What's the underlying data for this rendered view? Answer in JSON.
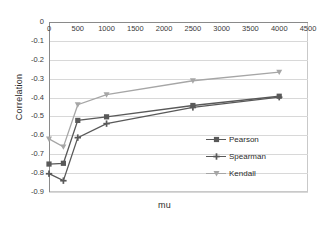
{
  "chart_data": {
    "type": "line",
    "title": "",
    "xlabel": "mu",
    "ylabel": "Correlation",
    "xlim": [
      0,
      4500
    ],
    "ylim": [
      -0.9,
      0
    ],
    "grid": true,
    "legend_position": "inside-right",
    "xticks": [
      "0",
      "500",
      "1000",
      "1500",
      "2000",
      "2500",
      "3000",
      "3500",
      "4000",
      "4500"
    ],
    "yticks": [
      "0",
      "-0.1",
      "-0.2",
      "-0.3",
      "-0.4",
      "-0.5",
      "-0.6",
      "-0.7",
      "-0.8",
      "-0.9"
    ],
    "x": [
      0,
      250,
      500,
      1000,
      2500,
      4000
    ],
    "series": [
      {
        "name": "Pearson",
        "marker": "square",
        "color": "#595959",
        "values": [
          -0.752,
          -0.748,
          -0.521,
          -0.502,
          -0.442,
          -0.393
        ]
      },
      {
        "name": "Spearman",
        "marker": "plus",
        "color": "#595959",
        "values": [
          -0.803,
          -0.84,
          -0.612,
          -0.538,
          -0.452,
          -0.398
        ]
      },
      {
        "name": "Kendall",
        "marker": "triangle-down",
        "color": "#a6a6a6",
        "values": [
          -0.619,
          -0.661,
          -0.438,
          -0.385,
          -0.311,
          -0.265
        ]
      }
    ]
  },
  "legend": {
    "items": [
      {
        "label": "Pearson"
      },
      {
        "label": "Spearman"
      },
      {
        "label": "Kendall"
      }
    ]
  },
  "colors": {
    "plot_background": "#ffffff",
    "gridline": "#d8d8d8",
    "axis": "#8a8a8a",
    "series_dark": "#595959",
    "series_light": "#a6a6a6",
    "text": "#2b2b2b"
  }
}
